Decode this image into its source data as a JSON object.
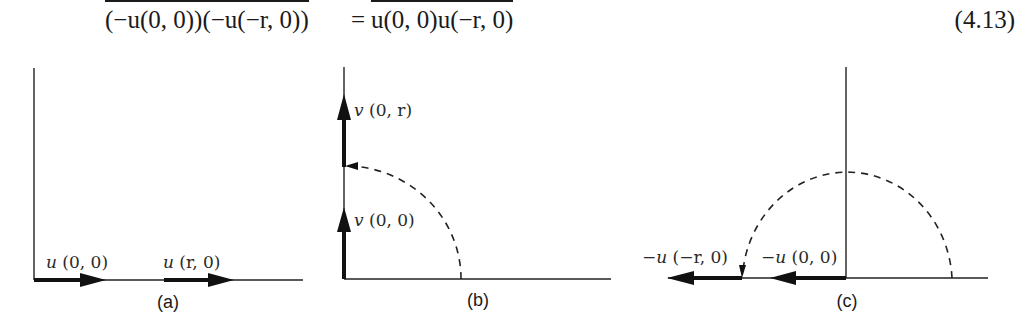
{
  "equation": {
    "lhs": "(−u(0, 0))(−u(−r, 0))",
    "equals": "=",
    "rhs": "u(0, 0)u(−r, 0)",
    "number": "(4.13)",
    "overbars": true
  },
  "figure": {
    "panels": [
      {
        "id": "a",
        "caption": "(a)",
        "vectors": [
          {
            "name": "u",
            "args": "(0, 0)",
            "direction": "right",
            "label": "u (0, 0)"
          },
          {
            "name": "u",
            "args": "(r, 0)",
            "direction": "right",
            "label": "u (r, 0)"
          }
        ]
      },
      {
        "id": "b",
        "caption": "(b)",
        "vectors": [
          {
            "name": "v",
            "args": "(0, r)",
            "direction": "up",
            "label": "v (0, r)"
          },
          {
            "name": "v",
            "args": "(0, 0)",
            "direction": "up",
            "label": "v (0, 0)"
          }
        ],
        "rotation": "quarter-circle dashed arc from (r,0) to (0,r)"
      },
      {
        "id": "c",
        "caption": "(c)",
        "vectors": [
          {
            "name": "-u",
            "args": "(−r, 0)",
            "direction": "left",
            "label": "−u (−r, 0)"
          },
          {
            "name": "-u",
            "args": "(0, 0)",
            "direction": "left",
            "label": "−u (0, 0)"
          }
        ],
        "rotation": "half-circle dashed arc from (r,0) to (−r,0)"
      }
    ],
    "labels": {
      "a_vec1": {
        "sym": "u",
        "args": " (0, 0)"
      },
      "a_vec2": {
        "sym": "u",
        "args": " (r, 0)"
      },
      "b_vec1": {
        "sym": "v",
        "args": " (0, r)"
      },
      "b_vec2": {
        "sym": "v",
        "args": " (0, 0)"
      },
      "c_vec1": {
        "sym": "−u",
        "args": " (−r, 0)"
      },
      "c_vec2": {
        "sym": "−u",
        "args": " (0, 0)"
      }
    },
    "captions": {
      "a": "(a)",
      "b": "(b)",
      "c": "(c)"
    }
  }
}
